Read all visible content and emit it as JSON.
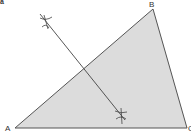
{
  "figure": {
    "panel_label": "a",
    "colors": {
      "fill": "#dcdcdc",
      "stroke": "#555555",
      "construction": "#444444"
    },
    "vertices": {
      "A": {
        "label": "A",
        "x": 15,
        "y": 128
      },
      "B": {
        "label": "B",
        "x": 153,
        "y": 9
      },
      "C": {
        "label": "C",
        "x": 187,
        "y": 128
      }
    },
    "perpendicular_bisector": {
      "start": {
        "x": 40,
        "y": 14
      },
      "end": {
        "x": 125,
        "y": 120
      },
      "arc_marks": [
        {
          "x": 46,
          "y": 22
        },
        {
          "x": 121,
          "y": 114
        }
      ]
    }
  }
}
